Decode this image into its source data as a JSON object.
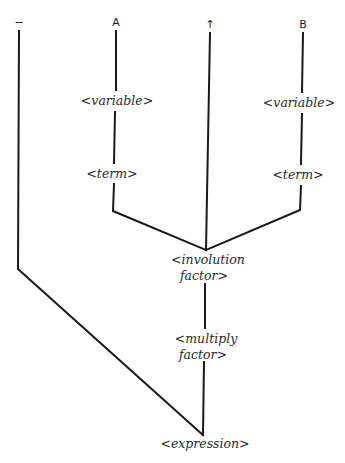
{
  "diagram": {
    "type": "parse-tree",
    "terminals": [
      {
        "id": "minus",
        "symbol": "−"
      },
      {
        "id": "A",
        "symbol": "A"
      },
      {
        "id": "up-arrow",
        "symbol": "↑"
      },
      {
        "id": "B",
        "symbol": "B"
      }
    ],
    "nodes": {
      "variable_left": "<variable>",
      "term_left": "<term>",
      "variable_right": "<variable>",
      "term_right": "<term>",
      "involution_factor_line1": "<involution",
      "involution_factor_line2": "factor>",
      "multiply_factor_line1": "<multiply",
      "multiply_factor_line2": "factor>",
      "expression": "<expression>"
    },
    "edges": [
      [
        "A",
        "variable_left"
      ],
      [
        "variable_left",
        "term_left"
      ],
      [
        "term_left",
        "involution_factor"
      ],
      [
        "up-arrow",
        "involution_factor"
      ],
      [
        "B",
        "variable_right"
      ],
      [
        "variable_right",
        "term_right"
      ],
      [
        "term_right",
        "involution_factor"
      ],
      [
        "involution_factor",
        "multiply_factor"
      ],
      [
        "multiply_factor",
        "expression"
      ],
      [
        "minus",
        "expression"
      ]
    ]
  }
}
